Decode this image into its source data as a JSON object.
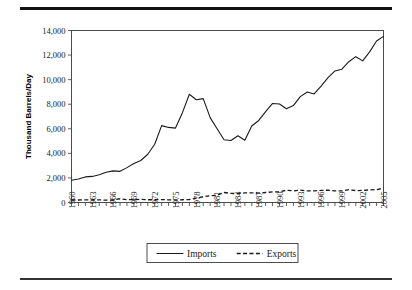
{
  "figure": {
    "rule_top": "horizontal-rule",
    "rule_bottom": "horizontal-rule"
  },
  "chart_data": {
    "type": "line",
    "title": "",
    "xlabel": "",
    "ylabel": "Thousand Barrels/Day",
    "ylim": [
      0,
      14000
    ],
    "ytick_values": [
      0,
      2000,
      4000,
      6000,
      8000,
      10000,
      12000,
      14000
    ],
    "ytick_labels": [
      "0",
      "2,000",
      "4,000",
      "6,000",
      "8,000",
      "10,000",
      "12,000",
      "14,000"
    ],
    "xlim": [
      1960,
      2005
    ],
    "xtick_labels": [
      "1960",
      "1963",
      "1966",
      "1969",
      "1972",
      "1975",
      "1978",
      "1981",
      "1984",
      "1987",
      "1990",
      "1993",
      "1996",
      "1999",
      "2002",
      "2005"
    ],
    "xtick_step": 3,
    "grid": false,
    "legend_position": "below-axes",
    "x": [
      1960,
      1961,
      1962,
      1963,
      1964,
      1965,
      1966,
      1967,
      1968,
      1969,
      1970,
      1971,
      1972,
      1973,
      1974,
      1975,
      1976,
      1977,
      1978,
      1979,
      1980,
      1981,
      1982,
      1983,
      1984,
      1985,
      1986,
      1987,
      1988,
      1989,
      1990,
      1991,
      1992,
      1993,
      1994,
      1995,
      1996,
      1997,
      1998,
      1999,
      2000,
      2001,
      2002,
      2003,
      2004,
      2005
    ],
    "series": [
      {
        "name": "Imports",
        "style": "solid",
        "values": [
          1815,
          1917,
          2082,
          2123,
          2259,
          2468,
          2573,
          2537,
          2840,
          3166,
          3419,
          3926,
          4741,
          6256,
          6112,
          6056,
          7313,
          8807,
          8363,
          8456,
          6909,
          5996,
          5113,
          5051,
          5437,
          5067,
          6224,
          6678,
          7402,
          8061,
          8018,
          7627,
          7888,
          8620,
          8996,
          8835,
          9478,
          10162,
          10708,
          10852,
          11459,
          11871,
          11530,
          12264,
          13145,
          13525
        ]
      },
      {
        "name": "Exports",
        "style": "dashed",
        "values": [
          202,
          205,
          207,
          208,
          221,
          187,
          198,
          306,
          231,
          233,
          259,
          224,
          222,
          231,
          221,
          209,
          223,
          243,
          362,
          471,
          544,
          595,
          815,
          739,
          722,
          781,
          785,
          764,
          815,
          859,
          857,
          1001,
          950,
          1003,
          942,
          949,
          981,
          1003,
          945,
          940,
          1040,
          971,
          984,
          1027,
          1048,
          1165
        ]
      }
    ],
    "legend": [
      {
        "label": "Imports",
        "style": "solid"
      },
      {
        "label": "Exports",
        "style": "dashed"
      }
    ]
  }
}
